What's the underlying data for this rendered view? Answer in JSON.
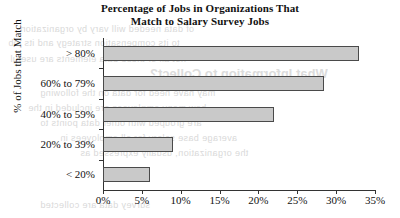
{
  "chart_data": {
    "type": "bar",
    "orientation": "horizontal",
    "title": "Percentage of Jobs in Organizations That Match to Salary Survey Jobs",
    "title_line1": "Percentage of Jobs in Organizations That",
    "title_line2": "Match to Salary Survey Jobs",
    "xlabel": "",
    "ylabel": "% of Jobs that Match",
    "categories": [
      "> 80%",
      "60% to 79%",
      "40% to 59%",
      "20% to 39%",
      "< 20%"
    ],
    "values": [
      33,
      28.5,
      22,
      9,
      6
    ],
    "xlim": [
      0,
      35
    ],
    "xticks": [
      0,
      5,
      10,
      15,
      20,
      25,
      30,
      35
    ],
    "xtick_labels": [
      "0%",
      "5%",
      "10%",
      "15%",
      "20%",
      "25%",
      "30%",
      "35%"
    ],
    "grid": false,
    "legend": false,
    "bar_fill_color": "#c9c9c9",
    "bar_border_color": "#4a4a4a",
    "axis_color": "#333333"
  },
  "artifacts": {
    "note": "faint mirrored bleed-through text from reverse page",
    "bleed_title": "What Information to Collect?",
    "bleed_lines": [
      "of data needed will vary by organization",
      "to its compensation strategy and its job",
      "not all of these data elements are useful",
      "may have need for data on the following",
      "how many employees are included in the",
      "are grouped with other data points to",
      "average base salary for all employees in",
      "the organization, usually expressed as",
      "whether data are reported as of a common"
    ],
    "bleed_footer": "survey data are collected"
  }
}
